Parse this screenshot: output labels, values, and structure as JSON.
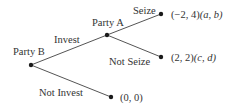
{
  "diagram": {
    "type": "game-tree",
    "nodes": {
      "party_b": {
        "label": "Party B"
      },
      "party_a": {
        "label": "Party A"
      },
      "seize_end": {
        "payoff": "(−2, 4)",
        "vars": "(a, b)"
      },
      "not_seize_end": {
        "payoff": "(2, 2)",
        "vars": "(c, d)"
      },
      "not_invest_end": {
        "payoff": "(0, 0)"
      }
    },
    "edges": {
      "invest": "Invest",
      "not_invest": "Not Invest",
      "seize": "Seize",
      "not_seize": "Not Seize"
    },
    "colors": {
      "line": "#555555",
      "node": "#1a1a1a",
      "text": "#333333"
    }
  }
}
